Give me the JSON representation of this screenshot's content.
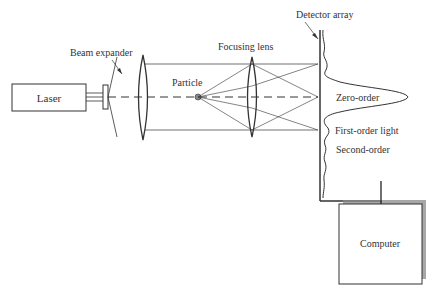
{
  "diagram": {
    "labels": {
      "laser": "Laser",
      "beam_expander": "Beam expander",
      "particle": "Particle",
      "focusing_lens": "Focusing lens",
      "detector_array": "Detector array",
      "zero_order": "Zero-order",
      "first_order": "First-order light",
      "second_order": "Second-order",
      "computer": "Computer"
    },
    "colors": {
      "stroke": "#333333",
      "shadow": "#8a8a8a",
      "particle": "#888888",
      "background": "#ffffff"
    }
  }
}
